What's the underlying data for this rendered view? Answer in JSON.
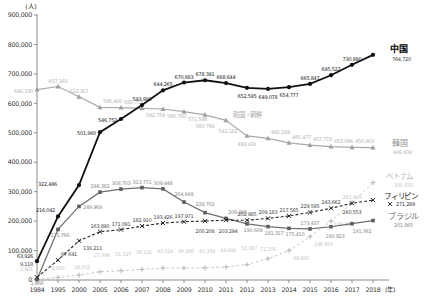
{
  "chart_data": {
    "type": "line",
    "title": "",
    "y_unit_label": "(人)",
    "x_unit_label": "(年)",
    "ylim": [
      0,
      900000
    ],
    "ytick_step": 100000,
    "legend_position": "right-inline",
    "grid": false,
    "categories": [
      "1984",
      "1995",
      "2000",
      "2005",
      "2006",
      "2007",
      "2008",
      "2009",
      "2010",
      "2011",
      "2012",
      "2013",
      "2014",
      "2015",
      "2016",
      "2017",
      "2018"
    ],
    "series": [
      {
        "id": "vietnam",
        "name": "ベトナム",
        "color": "#c6c6c6",
        "label_color": "#c8c8c8",
        "line": "dashed",
        "dash": "2.5,2.5",
        "width": 1,
        "marker": "plus",
        "marker_color": "#b8b8b8",
        "values": [
          2981,
          8680,
          16602,
          27996,
          31527,
          36131,
          40524,
          40495,
          41354,
          44444,
          52367,
          72256,
          99865,
          146956,
          199990,
          262405,
          330835
        ],
        "label_pos": [
          [
            -4,
            -8,
            "e"
          ],
          [
            0,
            -7,
            "m"
          ],
          [
            3,
            -6,
            "m"
          ],
          "a2",
          "a2",
          "a2",
          "a2",
          "a2",
          "a2",
          "a2",
          "a2",
          [
            0,
            -8,
            "m"
          ],
          "br",
          "br",
          [
            3,
            5,
            "s"
          ],
          "a",
          "n"
        ]
      },
      {
        "id": "korea",
        "name": "韓国",
        "color": "#aaaaaa",
        "label_color": "#b4b4b4",
        "line": "solid",
        "dash": "",
        "width": 1.2,
        "marker": "triangle",
        "marker_color": "#9e9e9e",
        "values": [
          646330,
          657160,
          622307,
          586400,
          585752,
          582754,
          580760,
          571598,
          560799,
          542182,
          489431,
          481249,
          465477,
          457772,
          453096,
          450663,
          449634
        ],
        "label_pos": [
          "l",
          "a",
          "a",
          "ar",
          "ar",
          "br",
          "br",
          "br",
          [
            0,
            13,
            "m"
          ],
          [
            2,
            13,
            "m"
          ],
          "b",
          "ar",
          "ar",
          "ar",
          "ar",
          "ar",
          "n"
        ]
      },
      {
        "id": "brazil",
        "name": "ブラジル",
        "color": "#6e6e6e",
        "label_color": "#8a8a8a",
        "line": "solid",
        "dash": "",
        "width": 1.2,
        "marker": "square",
        "marker_color": "#5e5e5e",
        "values": [
          1866,
          171766,
          249969,
          298382,
          308703,
          313771,
          309448,
          264649,
          228702,
          209265,
          190609,
          181317,
          175410,
          173437,
          180923,
          191362,
          201865
        ],
        "label_pos": [
          [
            0,
            6,
            "m"
          ],
          [
            2,
            8,
            "m"
          ],
          "r",
          "a",
          "a",
          "a",
          "a",
          [
            0,
            -6,
            "m"
          ],
          [
            0,
            -7,
            "m"
          ],
          [
            2,
            -4,
            "s"
          ],
          [
            6,
            8,
            "m"
          ],
          [
            6,
            8,
            "m"
          ],
          [
            6,
            8,
            "m"
          ],
          "a",
          [
            4,
            11,
            "m"
          ],
          [
            10,
            9,
            "m"
          ],
          "n"
        ]
      },
      {
        "id": "philippines",
        "name": "フィリピン",
        "color": "#2a2a2a",
        "label_color": "#444444",
        "line": "dashed",
        "dash": "3,2",
        "width": 1.1,
        "marker": "x",
        "marker_color": "#222222",
        "values": [
          9118,
          67641,
          133211,
          163890,
          171091,
          182910,
          193426,
          197971,
          200208,
          203294,
          202985,
          209183,
          217585,
          229595,
          243662,
          260553,
          271289
        ],
        "label_pos": [
          [
            -4,
            -11,
            "e"
          ],
          "ar",
          "br",
          "a",
          "a",
          "a",
          "a",
          "a",
          [
            0,
            12,
            "m"
          ],
          [
            2,
            13,
            "m"
          ],
          "a",
          "a",
          "a",
          "a",
          "a",
          [
            0,
            11,
            "m"
          ],
          "n"
        ]
      },
      {
        "id": "china",
        "name": "中国",
        "color": "#111111",
        "label_color": "#222222",
        "line": "solid",
        "dash": "",
        "width": 1.8,
        "marker": "circle",
        "marker_color": "#111111",
        "values": [
          63926,
          216042,
          322486,
          501960,
          546752,
          593993,
          644265,
          670683,
          678391,
          668644,
          652595,
          649078,
          654777,
          665847,
          695522,
          730890,
          764720
        ],
        "label_pos": [
          [
            -4,
            -3,
            "e"
          ],
          "al",
          [
            -22,
            1,
            "e"
          ],
          "l",
          "l",
          "a",
          "a",
          "a",
          "a",
          "a",
          "b",
          "b",
          "b",
          "a",
          "a",
          "a",
          "n"
        ]
      }
    ],
    "annotations": [
      {
        "id": "label-china",
        "text": "中国",
        "x": 390,
        "y": 52,
        "color": "#000000",
        "size": 9,
        "bold": true
      },
      {
        "id": "value-china-2018",
        "text": "764,720",
        "x": 392,
        "y": 61,
        "color": "#333333",
        "size": 5
      },
      {
        "id": "label-korea-chosen",
        "text": "韓国・朝鮮",
        "x": 233,
        "y": 117,
        "color": "#aaaaaa",
        "size": 6.3
      },
      {
        "id": "label-korea",
        "text": "韓国",
        "x": 392,
        "y": 146,
        "color": "#8d8d8d",
        "size": 8
      },
      {
        "id": "value-korea-2018",
        "text": "449,634",
        "x": 393,
        "y": 154,
        "color": "#b4b4b4",
        "size": 5
      },
      {
        "id": "label-vietnam",
        "text": "ベトナム",
        "x": 386,
        "y": 179,
        "color": "#bdbdbd",
        "size": 7.5
      },
      {
        "id": "value-vietnam-2018",
        "text": "330,835",
        "x": 394,
        "y": 187,
        "color": "#c8c8c8",
        "size": 5
      },
      {
        "id": "label-philippines",
        "text": "フィリピン",
        "x": 384,
        "y": 199,
        "color": "#1a1a1a",
        "size": 7.5
      },
      {
        "id": "value-philippines-2018",
        "text": "271,289",
        "x": 396,
        "y": 206,
        "color": "#333333",
        "size": 5,
        "marker": "x"
      },
      {
        "id": "label-brazil",
        "text": "ブラジル",
        "x": 388,
        "y": 219,
        "color": "#6e6e6e",
        "size": 8
      },
      {
        "id": "value-brazil-2018",
        "text": "201,865",
        "x": 394,
        "y": 227,
        "color": "#8a8a8a",
        "size": 5
      }
    ]
  }
}
